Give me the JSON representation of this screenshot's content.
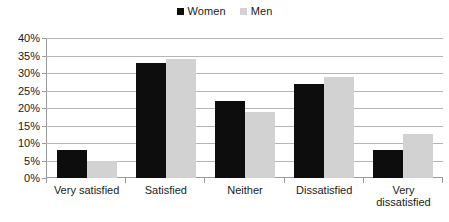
{
  "chart_data": {
    "type": "bar",
    "title": "",
    "subtitle": "",
    "xlabel": "",
    "ylabel": "",
    "categories": [
      "Very satisfied",
      "Satisfied",
      "Neither",
      "Dissatisfied",
      "Very\ndissatisfied"
    ],
    "series": [
      {
        "name": "Women",
        "color": "#0d0d0d",
        "values": [
          8,
          33,
          22,
          27,
          8
        ]
      },
      {
        "name": "Men",
        "color": "#d2d2d2",
        "values": [
          5,
          34,
          19,
          29,
          12.7
        ]
      }
    ],
    "ylim": [
      0,
      40
    ],
    "ytick_step": 5,
    "ytick_labels": [
      "40%",
      "35%",
      "30%",
      "25%",
      "20%",
      "15%",
      "10%",
      "5%",
      "0%"
    ],
    "ytick_values": [
      40,
      35,
      30,
      25,
      20,
      15,
      10,
      5,
      0
    ],
    "grid": true,
    "grid_axis": "y",
    "legend_position": "top-center",
    "value_suffix": "%"
  },
  "legend": {
    "entries": [
      {
        "label": "Women",
        "swatch_name": "legend-swatch-women"
      },
      {
        "label": "Men",
        "swatch_name": "legend-swatch-men"
      }
    ]
  },
  "colors": {
    "women": "#0d0d0d",
    "men": "#d2d2d2",
    "gridline": "#b5b5b5",
    "axis": "#9a9a9a",
    "text": "#1a1a1a",
    "background": "#ffffff"
  }
}
